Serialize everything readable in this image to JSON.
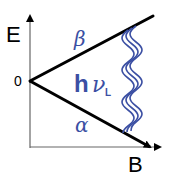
{
  "diagram": {
    "type": "zeeman-energy-level-splitting",
    "axes": {
      "y_label": "E",
      "x_label": "B",
      "origin_label": "0"
    },
    "levels": [
      {
        "name": "upper",
        "label": "β",
        "direction": "increasing with B"
      },
      {
        "name": "lower",
        "label": "α",
        "direction": "decreasing with B"
      }
    ],
    "transition": {
      "label_main": "h",
      "label_nu": "ν",
      "label_sub": "L",
      "style": "triple wavy line"
    },
    "colors": {
      "lines": "#000000",
      "axes": "#555555",
      "accent": "#3b4fa3"
    }
  }
}
